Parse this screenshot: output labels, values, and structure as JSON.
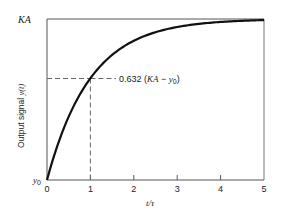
{
  "chart_data": {
    "type": "line",
    "title": "",
    "xlabel": "t/τ",
    "ylabel": "Output signal y(t)",
    "xlim": [
      0,
      5
    ],
    "ylim": [
      "y0",
      "KA"
    ],
    "x_ticks": [
      "0",
      "1",
      "2",
      "3",
      "4",
      "5"
    ],
    "y_ticks": [
      "y0",
      "KA"
    ],
    "grid": false,
    "series": [
      {
        "name": "y(t) = y0 + (KA - y0)(1 - e^(-t/τ))",
        "x": [
          0,
          0.25,
          0.5,
          0.75,
          1,
          1.5,
          2,
          2.5,
          3,
          3.5,
          4,
          4.5,
          5
        ],
        "values_normalized": [
          0,
          0.221,
          0.393,
          0.528,
          0.632,
          0.777,
          0.865,
          0.918,
          0.95,
          0.97,
          0.982,
          0.989,
          0.993
        ]
      }
    ],
    "annotations": [
      {
        "text": "0.632 (KA − y0)",
        "x": 1,
        "y_normalized": 0.632,
        "style": "dashed guide lines"
      }
    ]
  },
  "labels": {
    "y_top": "KA",
    "y_bottom_main": "y",
    "y_bottom_sub": "0",
    "ylabel_main": "Output signal ",
    "ylabel_var": "y(t)",
    "xlabel_t": "t",
    "xlabel_rest": "/τ",
    "annot_prefix": "0.632 (",
    "annot_ka": "KA",
    "annot_minus": " − ",
    "annot_y": "y",
    "annot_sub": "0",
    "annot_suffix": ")",
    "ticks": [
      "0",
      "1",
      "2",
      "3",
      "4",
      "5"
    ]
  }
}
